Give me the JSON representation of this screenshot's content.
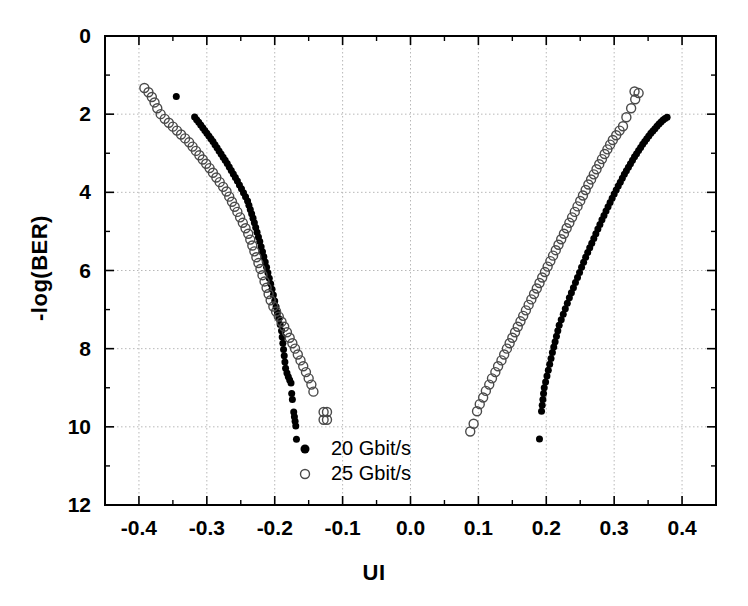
{
  "chart_data": {
    "type": "scatter",
    "title": "",
    "xlabel": "UI",
    "ylabel": "-log(BER)",
    "xlim": [
      -0.45,
      0.45
    ],
    "ylim": [
      12,
      0
    ],
    "y_inverted": true,
    "grid": true,
    "grid_style": "dotted",
    "legend_position": "bottom-center-inside",
    "x_ticks": [
      -0.4,
      -0.3,
      -0.2,
      -0.1,
      0.0,
      0.1,
      0.2,
      0.3,
      0.4
    ],
    "x_tick_labels": [
      "-0.4",
      "-0.3",
      "-0.2",
      "-0.1",
      "0.0",
      "0.1",
      "0.2",
      "0.3",
      "0.4"
    ],
    "x_minor_ticks": [
      -0.45,
      -0.35,
      -0.25,
      -0.15,
      -0.05,
      0.05,
      0.15,
      0.25,
      0.35,
      0.45
    ],
    "y_ticks": [
      0,
      2,
      4,
      6,
      8,
      10,
      12
    ],
    "y_tick_labels": [
      "0",
      "2",
      "4",
      "6",
      "8",
      "10",
      "12"
    ],
    "y_minor_ticks": [
      1,
      3,
      5,
      7,
      9,
      11
    ],
    "series": [
      {
        "name": "20 Gbit/s",
        "marker": "filled-circle",
        "color": "#000000",
        "marker_size": 7,
        "points": [
          [
            -0.345,
            1.55
          ],
          [
            -0.318,
            2.07
          ],
          [
            -0.315,
            2.14
          ],
          [
            -0.312,
            2.21
          ],
          [
            -0.309,
            2.28
          ],
          [
            -0.306,
            2.35
          ],
          [
            -0.303,
            2.42
          ],
          [
            -0.3,
            2.49
          ],
          [
            -0.297,
            2.56
          ],
          [
            -0.294,
            2.63
          ],
          [
            -0.291,
            2.7
          ],
          [
            -0.288,
            2.78
          ],
          [
            -0.285,
            2.86
          ],
          [
            -0.282,
            2.94
          ],
          [
            -0.279,
            3.02
          ],
          [
            -0.276,
            3.1
          ],
          [
            -0.273,
            3.18
          ],
          [
            -0.27,
            3.26
          ],
          [
            -0.267,
            3.35
          ],
          [
            -0.264,
            3.44
          ],
          [
            -0.261,
            3.53
          ],
          [
            -0.258,
            3.62
          ],
          [
            -0.255,
            3.71
          ],
          [
            -0.252,
            3.81
          ],
          [
            -0.249,
            3.91
          ],
          [
            -0.246,
            4.01
          ],
          [
            -0.243,
            4.11
          ],
          [
            -0.24,
            4.22
          ],
          [
            -0.238,
            4.33
          ],
          [
            -0.236,
            4.44
          ],
          [
            -0.234,
            4.55
          ],
          [
            -0.232,
            4.66
          ],
          [
            -0.23,
            4.78
          ],
          [
            -0.228,
            4.9
          ],
          [
            -0.226,
            5.02
          ],
          [
            -0.224,
            5.14
          ],
          [
            -0.222,
            5.26
          ],
          [
            -0.22,
            5.39
          ],
          [
            -0.218,
            5.52
          ],
          [
            -0.216,
            5.65
          ],
          [
            -0.214,
            5.78
          ],
          [
            -0.212,
            5.92
          ],
          [
            -0.21,
            6.06
          ],
          [
            -0.208,
            6.2
          ],
          [
            -0.206,
            6.34
          ],
          [
            -0.204,
            6.48
          ],
          [
            -0.202,
            6.63
          ],
          [
            -0.2,
            6.78
          ],
          [
            -0.198,
            6.93
          ],
          [
            -0.196,
            7.08
          ],
          [
            -0.194,
            7.23
          ],
          [
            -0.192,
            7.38
          ],
          [
            -0.19,
            7.54
          ],
          [
            -0.189,
            7.7
          ],
          [
            -0.188,
            7.86
          ],
          [
            -0.187,
            8.02
          ],
          [
            -0.186,
            8.18
          ],
          [
            -0.185,
            8.34
          ],
          [
            -0.184,
            8.5
          ],
          [
            -0.182,
            8.62
          ],
          [
            -0.18,
            8.72
          ],
          [
            -0.178,
            8.8
          ],
          [
            -0.176,
            8.88
          ],
          [
            -0.175,
            9.15
          ],
          [
            -0.174,
            9.3
          ],
          [
            -0.172,
            9.62
          ],
          [
            -0.171,
            9.74
          ],
          [
            -0.17,
            9.86
          ],
          [
            -0.169,
            9.98
          ],
          [
            -0.168,
            10.32
          ],
          [
            0.19,
            10.31
          ],
          [
            0.193,
            9.6
          ],
          [
            0.194,
            9.45
          ],
          [
            0.195,
            9.3
          ],
          [
            0.196,
            9.15
          ],
          [
            0.197,
            9.0
          ],
          [
            0.199,
            8.85
          ],
          [
            0.201,
            8.7
          ],
          [
            0.203,
            8.55
          ],
          [
            0.205,
            8.4
          ],
          [
            0.207,
            8.25
          ],
          [
            0.209,
            8.1
          ],
          [
            0.211,
            7.96
          ],
          [
            0.213,
            7.82
          ],
          [
            0.215,
            7.68
          ],
          [
            0.217,
            7.54
          ],
          [
            0.219,
            7.4
          ],
          [
            0.222,
            7.26
          ],
          [
            0.225,
            7.12
          ],
          [
            0.228,
            6.98
          ],
          [
            0.231,
            6.84
          ],
          [
            0.234,
            6.7
          ],
          [
            0.237,
            6.57
          ],
          [
            0.24,
            6.44
          ],
          [
            0.243,
            6.31
          ],
          [
            0.246,
            6.18
          ],
          [
            0.249,
            6.05
          ],
          [
            0.252,
            5.92
          ],
          [
            0.255,
            5.79
          ],
          [
            0.258,
            5.66
          ],
          [
            0.261,
            5.54
          ],
          [
            0.264,
            5.42
          ],
          [
            0.267,
            5.3
          ],
          [
            0.27,
            5.18
          ],
          [
            0.273,
            5.06
          ],
          [
            0.276,
            4.94
          ],
          [
            0.279,
            4.82
          ],
          [
            0.282,
            4.7
          ],
          [
            0.285,
            4.59
          ],
          [
            0.288,
            4.48
          ],
          [
            0.291,
            4.37
          ],
          [
            0.294,
            4.26
          ],
          [
            0.297,
            4.15
          ],
          [
            0.3,
            4.04
          ],
          [
            0.303,
            3.94
          ],
          [
            0.306,
            3.84
          ],
          [
            0.309,
            3.74
          ],
          [
            0.312,
            3.64
          ],
          [
            0.315,
            3.54
          ],
          [
            0.318,
            3.45
          ],
          [
            0.321,
            3.36
          ],
          [
            0.324,
            3.27
          ],
          [
            0.327,
            3.18
          ],
          [
            0.33,
            3.09
          ],
          [
            0.333,
            3.01
          ],
          [
            0.336,
            2.93
          ],
          [
            0.339,
            2.85
          ],
          [
            0.342,
            2.77
          ],
          [
            0.345,
            2.7
          ],
          [
            0.348,
            2.63
          ],
          [
            0.351,
            2.56
          ],
          [
            0.354,
            2.49
          ],
          [
            0.357,
            2.43
          ],
          [
            0.36,
            2.37
          ],
          [
            0.363,
            2.31
          ],
          [
            0.366,
            2.25
          ],
          [
            0.369,
            2.2
          ],
          [
            0.372,
            2.15
          ],
          [
            0.375,
            2.11
          ],
          [
            0.378,
            2.08
          ]
        ]
      },
      {
        "name": "25 Gbit/s",
        "marker": "open-circle",
        "color": "#000000",
        "marker_size": 9,
        "points": [
          [
            -0.392,
            1.33
          ],
          [
            -0.386,
            1.44
          ],
          [
            -0.381,
            1.56
          ],
          [
            -0.377,
            1.7
          ],
          [
            -0.373,
            1.85
          ],
          [
            -0.368,
            2.0
          ],
          [
            -0.362,
            2.12
          ],
          [
            -0.356,
            2.22
          ],
          [
            -0.35,
            2.32
          ],
          [
            -0.344,
            2.42
          ],
          [
            -0.338,
            2.52
          ],
          [
            -0.332,
            2.62
          ],
          [
            -0.326,
            2.72
          ],
          [
            -0.321,
            2.83
          ],
          [
            -0.316,
            2.94
          ],
          [
            -0.311,
            3.05
          ],
          [
            -0.306,
            3.16
          ],
          [
            -0.301,
            3.27
          ],
          [
            -0.296,
            3.38
          ],
          [
            -0.291,
            3.5
          ],
          [
            -0.286,
            3.62
          ],
          [
            -0.281,
            3.74
          ],
          [
            -0.276,
            3.86
          ],
          [
            -0.271,
            3.98
          ],
          [
            -0.267,
            4.11
          ],
          [
            -0.263,
            4.24
          ],
          [
            -0.259,
            4.37
          ],
          [
            -0.255,
            4.5
          ],
          [
            -0.251,
            4.64
          ],
          [
            -0.247,
            4.78
          ],
          [
            -0.243,
            4.92
          ],
          [
            -0.239,
            5.06
          ],
          [
            -0.236,
            5.21
          ],
          [
            -0.233,
            5.36
          ],
          [
            -0.23,
            5.51
          ],
          [
            -0.227,
            5.66
          ],
          [
            -0.224,
            5.81
          ],
          [
            -0.221,
            5.96
          ],
          [
            -0.218,
            6.12
          ],
          [
            -0.215,
            6.28
          ],
          [
            -0.212,
            6.44
          ],
          [
            -0.209,
            6.6
          ],
          [
            -0.206,
            6.76
          ],
          [
            -0.202,
            6.92
          ],
          [
            -0.198,
            7.05
          ],
          [
            -0.194,
            7.18
          ],
          [
            -0.19,
            7.31
          ],
          [
            -0.186,
            7.44
          ],
          [
            -0.182,
            7.58
          ],
          [
            -0.178,
            7.72
          ],
          [
            -0.174,
            7.86
          ],
          [
            -0.17,
            8.0
          ],
          [
            -0.166,
            8.15
          ],
          [
            -0.162,
            8.3
          ],
          [
            -0.158,
            8.45
          ],
          [
            -0.154,
            8.6
          ],
          [
            -0.15,
            8.76
          ],
          [
            -0.146,
            8.92
          ],
          [
            -0.143,
            9.1
          ],
          [
            -0.128,
            9.62
          ],
          [
            -0.123,
            9.62
          ],
          [
            -0.128,
            9.82
          ],
          [
            -0.123,
            9.82
          ],
          [
            0.088,
            10.12
          ],
          [
            0.093,
            9.92
          ],
          [
            0.098,
            9.6
          ],
          [
            0.102,
            9.42
          ],
          [
            0.107,
            9.25
          ],
          [
            0.111,
            9.08
          ],
          [
            0.116,
            8.92
          ],
          [
            0.12,
            8.76
          ],
          [
            0.125,
            8.6
          ],
          [
            0.129,
            8.45
          ],
          [
            0.134,
            8.3
          ],
          [
            0.138,
            8.15
          ],
          [
            0.142,
            8.0
          ],
          [
            0.146,
            7.86
          ],
          [
            0.15,
            7.72
          ],
          [
            0.154,
            7.58
          ],
          [
            0.158,
            7.44
          ],
          [
            0.162,
            7.3
          ],
          [
            0.166,
            7.16
          ],
          [
            0.17,
            7.02
          ],
          [
            0.174,
            6.88
          ],
          [
            0.178,
            6.74
          ],
          [
            0.182,
            6.6
          ],
          [
            0.186,
            6.46
          ],
          [
            0.19,
            6.32
          ],
          [
            0.194,
            6.18
          ],
          [
            0.198,
            6.04
          ],
          [
            0.202,
            5.9
          ],
          [
            0.206,
            5.76
          ],
          [
            0.21,
            5.62
          ],
          [
            0.214,
            5.48
          ],
          [
            0.218,
            5.34
          ],
          [
            0.222,
            5.2
          ],
          [
            0.226,
            5.06
          ],
          [
            0.23,
            4.92
          ],
          [
            0.234,
            4.78
          ],
          [
            0.238,
            4.64
          ],
          [
            0.242,
            4.5
          ],
          [
            0.246,
            4.36
          ],
          [
            0.25,
            4.22
          ],
          [
            0.254,
            4.08
          ],
          [
            0.258,
            3.94
          ],
          [
            0.262,
            3.8
          ],
          [
            0.266,
            3.67
          ],
          [
            0.27,
            3.54
          ],
          [
            0.274,
            3.41
          ],
          [
            0.278,
            3.28
          ],
          [
            0.282,
            3.15
          ],
          [
            0.286,
            3.02
          ],
          [
            0.29,
            2.9
          ],
          [
            0.294,
            2.78
          ],
          [
            0.298,
            2.66
          ],
          [
            0.303,
            2.54
          ],
          [
            0.308,
            2.42
          ],
          [
            0.313,
            2.31
          ],
          [
            0.318,
            2.08
          ],
          [
            0.325,
            1.85
          ],
          [
            0.331,
            1.62
          ],
          [
            0.336,
            1.46
          ],
          [
            0.33,
            1.42
          ]
        ]
      }
    ],
    "legend": [
      {
        "label": "20 Gbit/s",
        "marker": "filled-circle"
      },
      {
        "label": "25 Gbit/s",
        "marker": "open-circle"
      }
    ]
  }
}
